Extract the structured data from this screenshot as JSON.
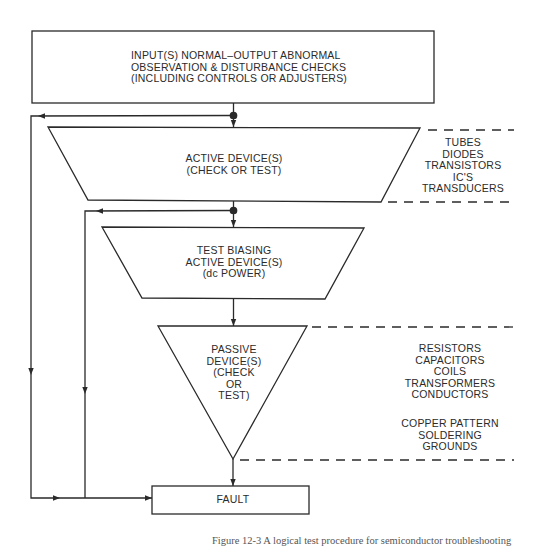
{
  "diagram": {
    "type": "troubleshooting-flowchart",
    "nodes": {
      "input_checks": {
        "shape": "rectangle",
        "lines": [
          "INPUT(S) NORMAL–OUTPUT ABNORMAL",
          "OBSERVATION & DISTURBANCE CHECKS",
          "(INCLUDING CONTROLS OR ADJUSTERS)"
        ]
      },
      "active_device": {
        "shape": "trapezoid",
        "lines": [
          "ACTIVE DEVICE(S)",
          "(CHECK OR TEST)"
        ]
      },
      "test_biasing": {
        "shape": "trapezoid",
        "lines": [
          "TEST BIASING",
          "ACTIVE DEVICE(S)",
          "(dc POWER)"
        ]
      },
      "passive_device": {
        "shape": "inverted-triangle",
        "lines": [
          "PASSIVE",
          "DEVICE(S)",
          "(CHECK",
          "OR",
          "TEST)"
        ]
      },
      "fault": {
        "shape": "rectangle",
        "label": "FAULT"
      }
    },
    "side_lists": {
      "active_components": [
        "TUBES",
        "DIODES",
        "TRANSISTORS",
        "IC'S",
        "TRANSDUCERS"
      ],
      "passive_components": [
        "RESISTORS",
        "CAPACITORS",
        "COILS",
        "TRANSFORMERS",
        "CONDUCTORS"
      ],
      "passive_other": [
        "COPPER PATTERN",
        "SOLDERING",
        "GROUNDS"
      ]
    },
    "edges": [
      {
        "from": "input_checks",
        "to": "active_device"
      },
      {
        "from": "active_device",
        "to": "test_biasing"
      },
      {
        "from": "test_biasing",
        "to": "passive_device"
      },
      {
        "from": "passive_device",
        "to": "fault"
      },
      {
        "from": "input_checks",
        "to": "fault",
        "via": "left-bypass"
      },
      {
        "from": "active_device",
        "to": "fault",
        "via": "left-bypass"
      }
    ],
    "caption": "Figure 12-3   A logical test procedure for semiconductor troubleshooting"
  },
  "colors": {
    "stroke": "#2a2a2a",
    "background": "#ffffff"
  }
}
